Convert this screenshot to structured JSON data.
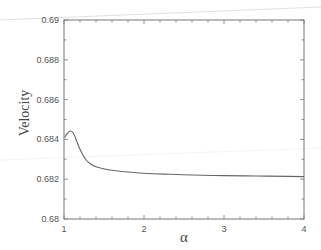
{
  "chart_data": {
    "type": "line",
    "title": "",
    "xlabel": "α",
    "ylabel": "Velocity",
    "xlim": [
      1,
      4
    ],
    "ylim": [
      0.68,
      0.69
    ],
    "grid": false,
    "legend": null,
    "x_ticks": [
      "1",
      "2",
      "3",
      "4"
    ],
    "y_ticks": [
      "0.68",
      "0.682",
      "0.684",
      "0.686",
      "0.688",
      "0.69"
    ],
    "series": [
      {
        "name": "Velocity",
        "x": [
          1.04,
          1.08,
          1.12,
          1.16,
          1.2,
          1.26,
          1.32,
          1.4,
          1.5,
          1.6,
          1.8,
          2.0,
          2.3,
          2.6,
          3.0,
          3.4,
          3.8,
          4.0
        ],
        "y": [
          0.6843,
          0.68442,
          0.6843,
          0.6839,
          0.6835,
          0.68305,
          0.6828,
          0.68262,
          0.68252,
          0.68245,
          0.68236,
          0.6823,
          0.68225,
          0.68221,
          0.68218,
          0.68216,
          0.68214,
          0.68213
        ]
      }
    ]
  }
}
